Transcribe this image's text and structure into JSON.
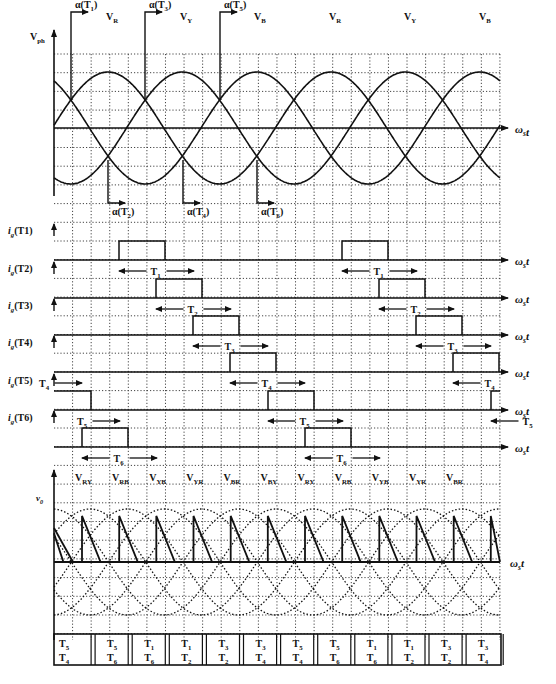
{
  "figure": {
    "type": "three-phase fully-controlled thyristor bridge waveforms",
    "caption_partial": ""
  },
  "axes": {
    "x_axis_label": "ωst",
    "phase_plot_ylabel": "Vph",
    "output_plot_ylabel": "v0"
  },
  "phase_plot": {
    "phase_labels": [
      "VR",
      "VY",
      "VB",
      "VR",
      "VY",
      "VB"
    ],
    "firing_top": [
      {
        "label": "α(T1)",
        "sub": "1"
      },
      {
        "label": "α(T3)",
        "sub": "3"
      },
      {
        "label": "α(T5)",
        "sub": "5"
      }
    ],
    "firing_bottom": [
      {
        "label": "α(T2)",
        "sub": "2"
      },
      {
        "label": "α(T4)",
        "sub": "4"
      },
      {
        "label": "α(T6)",
        "sub": "6"
      }
    ]
  },
  "gate_pulses": {
    "rows": [
      {
        "label": "ig(T1)",
        "thyristor": "T1"
      },
      {
        "label": "ig(T2)",
        "thyristor": "T2"
      },
      {
        "label": "ig(T3)",
        "thyristor": "T3"
      },
      {
        "label": "ig(T4)",
        "thyristor": "T4"
      },
      {
        "label": "ig(T5)",
        "thyristor": "T5"
      },
      {
        "label": "ig(T6)",
        "thyristor": "T6"
      }
    ],
    "conduction_labels": [
      "T1",
      "T2",
      "T3",
      "T4",
      "T5",
      "T6"
    ]
  },
  "output_plot": {
    "line_voltage_labels": [
      "VRY",
      "VRB",
      "VYB",
      "VYR",
      "VBR",
      "VBY",
      "VRY",
      "VRB",
      "VYB",
      "VYR",
      "VBR"
    ]
  },
  "conduction_table": {
    "cells": [
      {
        "top": "T5",
        "bottom": "T4"
      },
      {
        "top": "T5",
        "bottom": "T6"
      },
      {
        "top": "T1",
        "bottom": "T6"
      },
      {
        "top": "T1",
        "bottom": "T2"
      },
      {
        "top": "T3",
        "bottom": "T2"
      },
      {
        "top": "T3",
        "bottom": "T4"
      },
      {
        "top": "T5",
        "bottom": "T4"
      },
      {
        "top": "T5",
        "bottom": "T6"
      },
      {
        "top": "T1",
        "bottom": "T6"
      },
      {
        "top": "T1",
        "bottom": "T2"
      },
      {
        "top": "T3",
        "bottom": "T2"
      },
      {
        "top": "T3",
        "bottom": "T4"
      }
    ]
  },
  "colors": {
    "ink": "#111111",
    "grid": "#333333",
    "background": "#ffffff"
  }
}
